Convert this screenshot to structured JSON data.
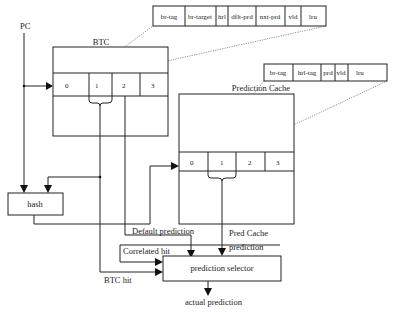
{
  "diagram": {
    "inputs": {
      "pc": "PC"
    },
    "btc": {
      "title": "BTC",
      "entries": [
        "0",
        "1",
        "2",
        "3"
      ],
      "fields": [
        "br-tag",
        "br-target",
        "hrl",
        "dflt-prd",
        "nxt-prd",
        "vld",
        "lru"
      ]
    },
    "prediction_cache": {
      "title": "Prediction Cache",
      "entries": [
        "0",
        "1",
        "2",
        "3"
      ],
      "fields": [
        "br-tag",
        "hrl-tag",
        "prd",
        "vld",
        "lru"
      ]
    },
    "hash": {
      "label": "hash"
    },
    "selector": {
      "label": "prediction selector"
    },
    "signals": {
      "default_prediction": "Default prediction",
      "correlated_hit": "Correlated hit",
      "btc_hit": "BTC hit",
      "pred_cache_line1": "Pred Cache",
      "pred_cache_line2": "prediction",
      "actual_prediction": "actual prediction"
    }
  }
}
